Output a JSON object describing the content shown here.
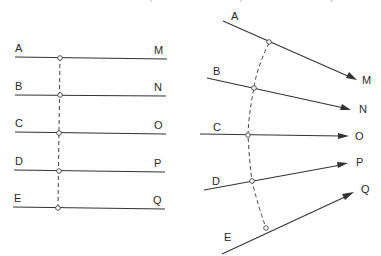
{
  "figure": {
    "left_diagram": {
      "title": "parallel-lines",
      "lines": [
        {
          "start_label": "A",
          "end_label": "M",
          "y": 57
        },
        {
          "start_label": "B",
          "end_label": "N",
          "y": 95
        },
        {
          "start_label": "C",
          "end_label": "O",
          "y": 132
        },
        {
          "start_label": "D",
          "end_label": "P",
          "y": 170
        },
        {
          "start_label": "E",
          "end_label": "Q",
          "y": 207
        }
      ],
      "connector": "dashed vertical line through intersection points"
    },
    "right_diagram": {
      "title": "converging-arrows",
      "lines": [
        {
          "start_label": "A",
          "end_label": "M"
        },
        {
          "start_label": "B",
          "end_label": "N"
        },
        {
          "start_label": "C",
          "end_label": "O"
        },
        {
          "start_label": "D",
          "end_label": "P"
        },
        {
          "start_label": "E",
          "end_label": "Q"
        }
      ],
      "connector": "dashed curved line through intersection points"
    }
  },
  "colors": {
    "line": "#333333",
    "background": "#ffffff"
  }
}
